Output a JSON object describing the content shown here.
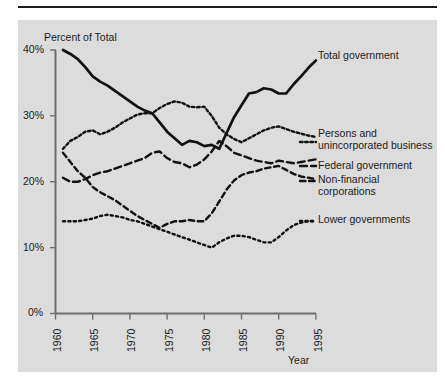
{
  "figure": {
    "background": "#dcdcdc",
    "ink": "#111111"
  },
  "axes": {
    "ylabel": "Percent of Total",
    "xlabel": "Year",
    "yticks": [
      "0%",
      "10%",
      "20%",
      "30%",
      "40%"
    ],
    "xticks": [
      "1960",
      "1965",
      "1970",
      "1975",
      "1980",
      "1985",
      "1990",
      "1995"
    ]
  },
  "series_labels": {
    "total": "Total government",
    "persons_line1": "Persons and",
    "persons_line2": "unincorporated business",
    "federal": "Federal government",
    "nonfin_line1": "Non-financial",
    "nonfin_line2": "corporations",
    "lower": "Lower governments"
  },
  "chart_data": {
    "type": "line",
    "title": "",
    "xlabel": "Year",
    "ylabel": "Percent of Total",
    "xlim": [
      1960,
      1995
    ],
    "ylim": [
      0,
      40
    ],
    "yticks": [
      0,
      10,
      20,
      30,
      40
    ],
    "xticks": [
      1960,
      1965,
      1970,
      1975,
      1980,
      1985,
      1990,
      1995
    ],
    "ytick_labels": [
      "0%",
      "10%",
      "20%",
      "30%",
      "40%"
    ],
    "grid": false,
    "legend": "inline-right-labels",
    "x": [
      1961,
      1962,
      1963,
      1964,
      1965,
      1966,
      1967,
      1968,
      1969,
      1970,
      1971,
      1972,
      1973,
      1974,
      1975,
      1976,
      1977,
      1978,
      1979,
      1980,
      1981,
      1982,
      1983,
      1984,
      1985,
      1986,
      1987,
      1988,
      1989,
      1990,
      1991,
      1992,
      1993,
      1994,
      1995
    ],
    "series": [
      {
        "name": "Total government",
        "style": "solid",
        "values": [
          40.0,
          39.4,
          38.6,
          37.4,
          36.0,
          35.2,
          34.6,
          33.8,
          33.0,
          32.2,
          31.4,
          30.8,
          30.4,
          29.0,
          27.6,
          26.6,
          25.6,
          26.2,
          26.0,
          25.4,
          25.6,
          25.0,
          27.4,
          29.8,
          31.6,
          33.4,
          33.6,
          34.2,
          34.0,
          33.4,
          33.4,
          34.8,
          36.0,
          37.3,
          38.4
        ]
      },
      {
        "name": "Persons and unincorporated business",
        "style": "fine-dotted",
        "values": [
          25.0,
          26.2,
          26.8,
          27.6,
          27.8,
          27.2,
          27.6,
          28.2,
          29.0,
          29.6,
          30.2,
          30.4,
          30.4,
          31.2,
          31.8,
          32.2,
          32.0,
          31.4,
          31.3,
          31.4,
          30.0,
          28.2,
          27.2,
          26.5,
          26.0,
          26.6,
          27.2,
          27.8,
          28.2,
          28.4,
          28.0,
          27.6,
          27.3,
          27.0,
          26.8
        ]
      },
      {
        "name": "Federal government",
        "style": "long-dash",
        "values": [
          20.6,
          20.0,
          20.0,
          20.4,
          21.0,
          21.4,
          21.6,
          22.0,
          22.4,
          22.8,
          23.2,
          23.6,
          24.4,
          24.6,
          23.6,
          23.0,
          22.8,
          22.2,
          22.6,
          23.4,
          24.6,
          26.2,
          25.4,
          24.4,
          24.0,
          23.6,
          23.2,
          23.0,
          22.8,
          23.2,
          23.0,
          22.8,
          23.0,
          23.2,
          23.4
        ]
      },
      {
        "name": "Non-financial corporations",
        "style": "medium-dash",
        "values": [
          24.4,
          23.0,
          21.6,
          20.6,
          19.2,
          18.4,
          17.8,
          17.2,
          16.4,
          15.6,
          14.8,
          14.2,
          13.6,
          13.0,
          13.6,
          14.0,
          14.0,
          14.2,
          14.0,
          14.0,
          15.2,
          17.0,
          18.8,
          20.2,
          21.0,
          21.4,
          21.6,
          22.0,
          22.2,
          22.4,
          21.8,
          21.2,
          20.8,
          20.6,
          20.4
        ]
      },
      {
        "name": "Lower governments",
        "style": "dotted",
        "values": [
          14.0,
          14.0,
          14.0,
          14.2,
          14.4,
          14.8,
          15.0,
          14.8,
          14.6,
          14.2,
          14.0,
          13.6,
          13.2,
          12.8,
          12.4,
          12.0,
          11.6,
          11.2,
          10.8,
          10.4,
          10.0,
          10.8,
          11.4,
          11.8,
          11.8,
          11.6,
          11.2,
          10.8,
          10.8,
          11.6,
          12.6,
          13.4,
          13.8,
          14.0,
          14.0
        ]
      }
    ]
  }
}
